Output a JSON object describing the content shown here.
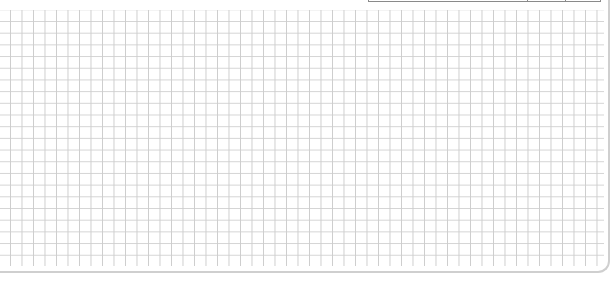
{
  "canvas": {
    "type": "grid-paper",
    "background_color": "#ffffff",
    "grid_line_color": "#cdcdcd",
    "grid_cell_size_px": 11.5,
    "border_color": "#cfcfcf"
  },
  "top_box": {
    "columns": 3,
    "border_color": "#8a8a8a"
  }
}
